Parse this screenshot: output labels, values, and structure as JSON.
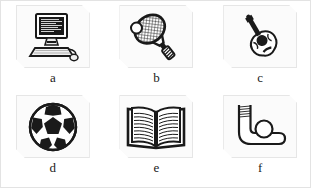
{
  "page": {
    "background_color": "#ffffff",
    "border_color": "#e3e3e3",
    "card_background": "#fbfbfb",
    "ink_color": "#1a1a1a"
  },
  "grid": {
    "columns": 3,
    "rows": 2,
    "cells": [
      {
        "label": "a",
        "icon": "computer-icon",
        "alt": "desktop computer with monitor, keyboard and mouse"
      },
      {
        "label": "b",
        "icon": "tennis-racket-icon",
        "alt": "tennis racket with ball"
      },
      {
        "label": "c",
        "icon": "guitar-icon",
        "alt": "acoustic guitar"
      },
      {
        "label": "d",
        "icon": "soccer-ball-icon",
        "alt": "soccer ball"
      },
      {
        "label": "e",
        "icon": "open-book-icon",
        "alt": "open book with pages of text"
      },
      {
        "label": "f",
        "icon": "hockey-stick-icon",
        "alt": "hockey stick with ball"
      }
    ]
  }
}
